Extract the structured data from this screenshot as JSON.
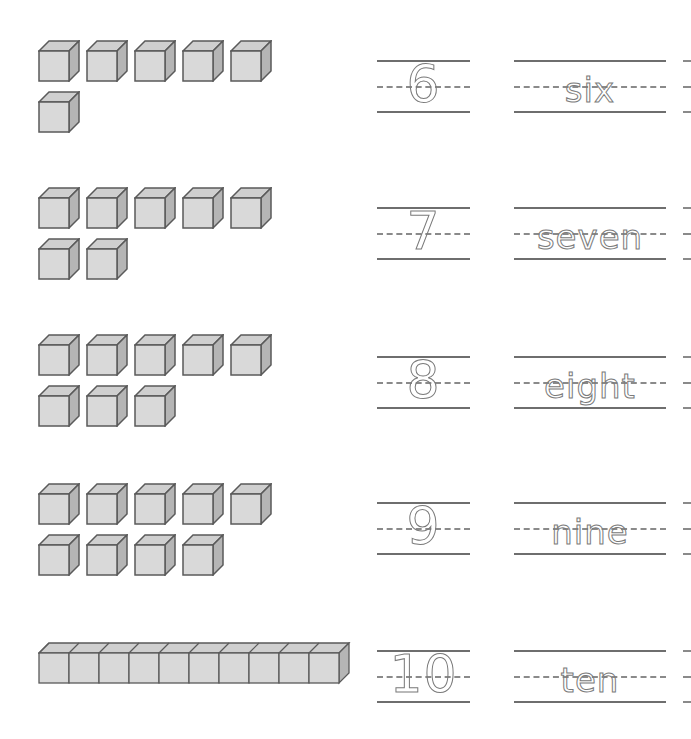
{
  "worksheet": {
    "rows": [
      {
        "count": 6,
        "number": "6",
        "word": "six",
        "cube_rows": [
          5,
          1
        ]
      },
      {
        "count": 7,
        "number": "7",
        "word": "seven",
        "cube_rows": [
          5,
          2
        ]
      },
      {
        "count": 8,
        "number": "8",
        "word": "eight",
        "cube_rows": [
          5,
          3
        ]
      },
      {
        "count": 9,
        "number": "9",
        "word": "nine",
        "cube_rows": [
          5,
          4
        ]
      },
      {
        "count": 10,
        "number": "10",
        "word": "ten",
        "rod": true
      }
    ]
  },
  "colors": {
    "cube_face": "#d9d9d9",
    "cube_top": "#cfcfcf",
    "cube_side": "#b5b5b5",
    "cube_edge": "#5a5a5a",
    "line": "#6e6e6e",
    "trace": "#7a7a7a"
  }
}
